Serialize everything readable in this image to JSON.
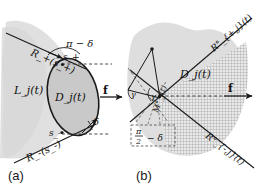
{
  "figure": {
    "title": "",
    "background_color": "#ffffff",
    "ink_color": "#1a1a1a",
    "region_fill_light": "#dcdcdc",
    "region_fill_mid": "#c4c4c4",
    "hatch_color": "#8c8c8c"
  },
  "panels": [
    {
      "id": "a",
      "label": "(a)",
      "labels": {
        "outer_region": "L_j(t)",
        "inner_region": "D_j(t)",
        "ray_upper": "R_+(s_+)",
        "ray_lower": "R_-(s_-)",
        "point_upper": "s_+",
        "point_lower": "s_-",
        "angle_upper": "π − δ",
        "angle_lower": "δ",
        "force": "f"
      }
    },
    {
      "id": "b",
      "label": "(b)",
      "labels": {
        "inner_region": "D_j(t)",
        "ray_upper": "R°_{+,j}(t)",
        "ray_lower": "R°_{-,j}(t)",
        "wedge_label": "M°_j(t)",
        "angle_left": "γ",
        "angle_mid": "γ",
        "boxed_angle": "π/2 − δ",
        "boxed_angle_num": "π",
        "boxed_angle_den": "2",
        "boxed_angle_rest": "− δ",
        "force": "f"
      }
    }
  ],
  "glyphs": {
    "pi": "π",
    "delta": "δ",
    "gamma": "γ",
    "minus": "−",
    "degree": "◦",
    "plus": "+"
  }
}
